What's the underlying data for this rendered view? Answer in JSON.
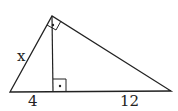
{
  "diagram": {
    "type": "right-triangle-altitude",
    "labels": {
      "hypotenuse_left_leg": "x",
      "left_segment": "4",
      "right_segment": "12"
    },
    "right_angle_markers": [
      "apex",
      "altitude-foot"
    ],
    "line_color": "#222222"
  }
}
